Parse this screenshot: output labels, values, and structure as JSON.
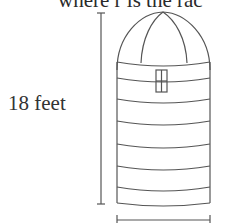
{
  "caption": "where r is the rac",
  "height_label": "18 feet",
  "figure": {
    "stroke_color": "#555555",
    "parts": [
      "hemispherical-dome",
      "cylindrical-body",
      "window",
      "height-dimension-line",
      "width-dimension-line"
    ]
  }
}
